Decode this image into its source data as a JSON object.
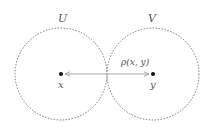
{
  "diagram": {
    "sets": [
      {
        "label": "U",
        "center": [
          61,
          74
        ],
        "radius": 46
      },
      {
        "label": "V",
        "center": [
          153,
          74
        ],
        "radius": 46
      }
    ],
    "points": [
      {
        "label": "x",
        "pos": [
          61,
          74
        ]
      },
      {
        "label": "y",
        "pos": [
          153,
          74
        ]
      }
    ],
    "edge": {
      "label": "ρ(x, y)",
      "from": "x",
      "to": "y",
      "style": "double-arrow"
    },
    "colors": {
      "circle": "#777777",
      "arrow": "#aaaaaa",
      "point": "#111111",
      "text": "#555555"
    }
  }
}
